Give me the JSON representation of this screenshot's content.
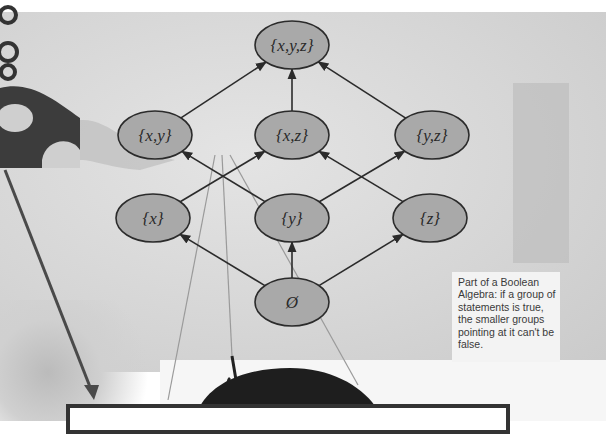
{
  "diagram": {
    "nodes": [
      {
        "id": "xyz",
        "label": "{x,y,z}",
        "cx": 292,
        "cy": 45
      },
      {
        "id": "xy",
        "label": "{x,y}",
        "cx": 155,
        "cy": 135
      },
      {
        "id": "xz",
        "label": "{x,z}",
        "cx": 292,
        "cy": 135
      },
      {
        "id": "yz",
        "label": "{y,z}",
        "cx": 432,
        "cy": 135
      },
      {
        "id": "x",
        "label": "{x}",
        "cx": 153,
        "cy": 218
      },
      {
        "id": "y",
        "label": "{y}",
        "cx": 292,
        "cy": 218
      },
      {
        "id": "z",
        "label": "{z}",
        "cx": 430,
        "cy": 218
      },
      {
        "id": "empty",
        "label": "Ø",
        "cx": 292,
        "cy": 302
      }
    ],
    "edges": [
      {
        "from": "xy",
        "to": "xyz"
      },
      {
        "from": "xz",
        "to": "xyz"
      },
      {
        "from": "yz",
        "to": "xyz"
      },
      {
        "from": "x",
        "to": "xz"
      },
      {
        "from": "y",
        "to": "xy"
      },
      {
        "from": "y",
        "to": "yz"
      },
      {
        "from": "z",
        "to": "xz"
      },
      {
        "from": "empty",
        "to": "x"
      },
      {
        "from": "empty",
        "to": "y"
      },
      {
        "from": "empty",
        "to": "z"
      }
    ],
    "colors": {
      "node_fill": "#a9a9a9",
      "node_stroke": "#2b2b2b",
      "edge": "#2b2b2b",
      "label": "#2a2a2a"
    }
  },
  "caption": {
    "text": "Part of a Boolean Algebra: if a group of statements is true, the smaller groups pointing at it can't be false."
  },
  "bottom_box": {
    "text": ""
  }
}
